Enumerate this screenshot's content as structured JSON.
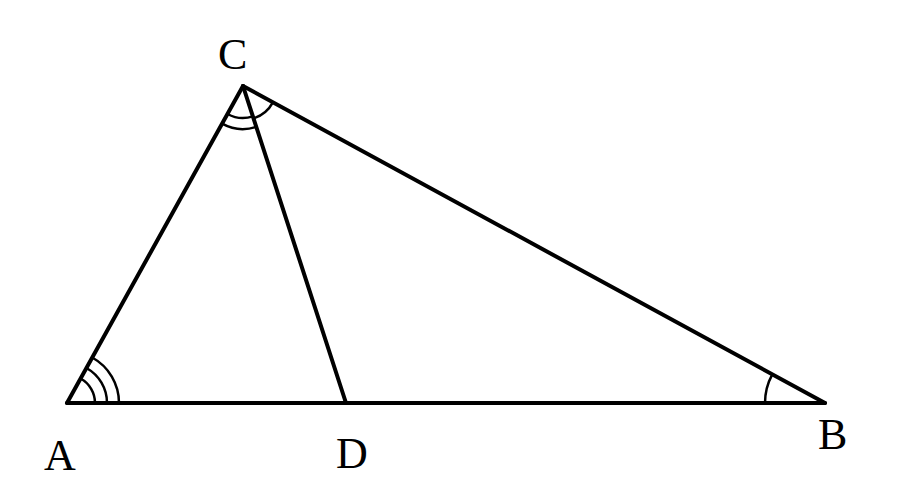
{
  "diagram": {
    "type": "geometry-triangle",
    "colors": {
      "stroke": "#000000",
      "background": "#ffffff"
    },
    "points": {
      "A": {
        "label": "A",
        "x": 67,
        "y": 403,
        "label_x": 44,
        "label_y": 470
      },
      "B": {
        "label": "B",
        "x": 825,
        "y": 403,
        "label_x": 818,
        "label_y": 449
      },
      "C": {
        "label": "C",
        "x": 243,
        "y": 86,
        "label_x": 218,
        "label_y": 69
      },
      "D": {
        "label": "D",
        "x": 346,
        "y": 403,
        "label_x": 336,
        "label_y": 468
      }
    },
    "segments": [
      {
        "name": "AC",
        "from": "A",
        "to": "C"
      },
      {
        "name": "CB",
        "from": "C",
        "to": "B"
      },
      {
        "name": "AB",
        "from": "A",
        "to": "B"
      },
      {
        "name": "CD",
        "from": "C",
        "to": "D"
      }
    ],
    "angle_marks": [
      {
        "name": "angle-A",
        "vertex": "A",
        "arcs": 3,
        "between": [
          "C",
          "B"
        ]
      },
      {
        "name": "angle-ACD",
        "vertex": "C",
        "arcs": 2,
        "between": [
          "A",
          "D"
        ]
      },
      {
        "name": "angle-DCB",
        "vertex": "C",
        "arcs": 1,
        "between": [
          "D",
          "B"
        ]
      },
      {
        "name": "angle-B",
        "vertex": "B",
        "arcs": 1,
        "between": [
          "A",
          "C"
        ]
      }
    ]
  }
}
